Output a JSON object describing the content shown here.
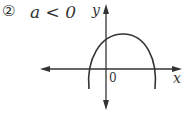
{
  "problem": {
    "number": "②",
    "condition": "a < 0"
  },
  "axes": {
    "x_label": "x",
    "y_label": "y",
    "origin_label": "0"
  },
  "curve": {
    "type": "downward-opening parabola",
    "color": "#333333"
  }
}
